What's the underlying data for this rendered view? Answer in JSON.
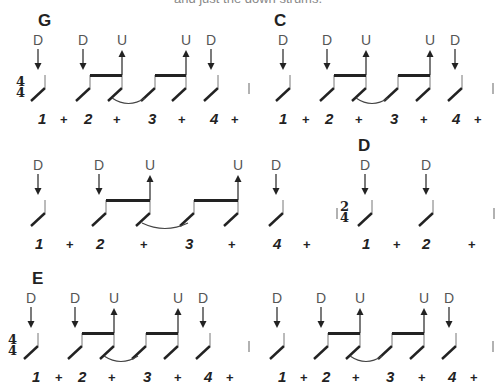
{
  "top_text": "and just the down strums.",
  "rows": [
    {
      "y": 0,
      "measures": [
        {
          "chord": "G",
          "chord_x": 38,
          "time_signature": {
            "top": "4",
            "bottom": "4",
            "x": 16
          },
          "notes": [
            {
              "x": 45,
              "strum": "D"
            },
            {
              "x": 90,
              "strum": "D"
            },
            {
              "x": 122,
              "strum": "U"
            },
            {
              "x": 155,
              "strum": null
            },
            {
              "x": 186,
              "strum": "U"
            },
            {
              "x": 218,
              "strum": "D"
            }
          ],
          "beams": [
            [
              90,
              122
            ],
            [
              155,
              186
            ]
          ],
          "ties": [
            [
              112,
              145
            ]
          ],
          "counts": [
            {
              "t": "1",
              "x": 38
            },
            {
              "t": "+",
              "x": 60
            },
            {
              "t": "2",
              "x": 84
            },
            {
              "t": "+",
              "x": 113
            },
            {
              "t": "3",
              "x": 148
            },
            {
              "t": "+",
              "x": 178
            },
            {
              "t": "4",
              "x": 210
            },
            {
              "t": "+",
              "x": 231
            }
          ],
          "barline_x": 249
        },
        {
          "chord": "C",
          "chord_x": 274,
          "time_signature": null,
          "notes": [
            {
              "x": 290,
              "strum": "D"
            },
            {
              "x": 334,
              "strum": "D"
            },
            {
              "x": 366,
              "strum": "U"
            },
            {
              "x": 398,
              "strum": null
            },
            {
              "x": 430,
              "strum": "U"
            },
            {
              "x": 462,
              "strum": "D"
            }
          ],
          "beams": [
            [
              334,
              366
            ],
            [
              398,
              430
            ]
          ],
          "ties": [
            [
              356,
              388
            ]
          ],
          "counts": [
            {
              "t": "1",
              "x": 279
            },
            {
              "t": "+",
              "x": 302
            },
            {
              "t": "2",
              "x": 325
            },
            {
              "t": "+",
              "x": 355
            },
            {
              "t": "3",
              "x": 390
            },
            {
              "t": "+",
              "x": 420
            },
            {
              "t": "4",
              "x": 452
            },
            {
              "t": "+",
              "x": 474
            }
          ],
          "barline_x": 493
        }
      ]
    },
    {
      "y": 125,
      "measures": [
        {
          "chord": null,
          "time_signature": null,
          "notes": [
            {
              "x": 45,
              "strum": "D"
            },
            {
              "x": 106,
              "strum": "D"
            },
            {
              "x": 150,
              "strum": "U"
            },
            {
              "x": 194,
              "strum": null
            },
            {
              "x": 238,
              "strum": "U"
            },
            {
              "x": 283,
              "strum": "D"
            }
          ],
          "beams": [
            [
              106,
              150
            ],
            [
              194,
              238
            ]
          ],
          "ties": [
            [
              142,
              188
            ]
          ],
          "counts": [
            {
              "t": "1",
              "x": 35
            },
            {
              "t": "+",
              "x": 66
            },
            {
              "t": "2",
              "x": 96
            },
            {
              "t": "+",
              "x": 140
            },
            {
              "t": "3",
              "x": 185
            },
            {
              "t": "+",
              "x": 228
            },
            {
              "t": "4",
              "x": 273
            },
            {
              "t": "+",
              "x": 303
            }
          ],
          "barline_x": null
        },
        {
          "chord": "D",
          "chord_x": 358,
          "time_signature": {
            "top": "2",
            "bottom": "4",
            "x": 340,
            "bar_before": true
          },
          "notes": [
            {
              "x": 372,
              "strum": "D"
            },
            {
              "x": 433,
              "strum": "D"
            }
          ],
          "beams": [],
          "ties": [],
          "counts": [
            {
              "t": "1",
              "x": 362
            },
            {
              "t": "+",
              "x": 393
            },
            {
              "t": "2",
              "x": 422
            },
            {
              "t": "+",
              "x": 468
            }
          ],
          "barline_x": 494
        }
      ]
    },
    {
      "y": 258,
      "measures": [
        {
          "chord": "E",
          "chord_x": 32,
          "time_signature": {
            "top": "4",
            "bottom": "4",
            "x": 8
          },
          "notes": [
            {
              "x": 38,
              "strum": "D"
            },
            {
              "x": 82,
              "strum": "D"
            },
            {
              "x": 114,
              "strum": "U"
            },
            {
              "x": 146,
              "strum": null
            },
            {
              "x": 178,
              "strum": "U"
            },
            {
              "x": 210,
              "strum": "D"
            }
          ],
          "beams": [
            [
              82,
              114
            ],
            [
              146,
              178
            ]
          ],
          "ties": [
            [
              104,
              138
            ]
          ],
          "counts": [
            {
              "t": "1",
              "x": 32
            },
            {
              "t": "+",
              "x": 55
            },
            {
              "t": "2",
              "x": 78
            },
            {
              "t": "+",
              "x": 108
            },
            {
              "t": "3",
              "x": 143
            },
            {
              "t": "+",
              "x": 174
            },
            {
              "t": "4",
              "x": 204
            },
            {
              "t": "+",
              "x": 226
            }
          ],
          "barline_x": 249
        },
        {
          "chord": null,
          "time_signature": null,
          "notes": [
            {
              "x": 284,
              "strum": "D"
            },
            {
              "x": 328,
              "strum": "D"
            },
            {
              "x": 360,
              "strum": "U"
            },
            {
              "x": 392,
              "strum": null
            },
            {
              "x": 424,
              "strum": "U"
            },
            {
              "x": 456,
              "strum": "D"
            }
          ],
          "beams": [
            [
              328,
              360
            ],
            [
              392,
              424
            ]
          ],
          "ties": [
            [
              350,
              382
            ]
          ],
          "counts": [
            {
              "t": "1",
              "x": 278
            },
            {
              "t": "+",
              "x": 300
            },
            {
              "t": "2",
              "x": 322
            },
            {
              "t": "+",
              "x": 352
            },
            {
              "t": "3",
              "x": 386
            },
            {
              "t": "+",
              "x": 418
            },
            {
              "t": "4",
              "x": 448
            },
            {
              "t": "+",
              "x": 470
            }
          ],
          "barline_x": 493
        }
      ]
    }
  ],
  "colors": {
    "ink": "#222222",
    "strum_label": "#555555",
    "barline": "#999999"
  }
}
